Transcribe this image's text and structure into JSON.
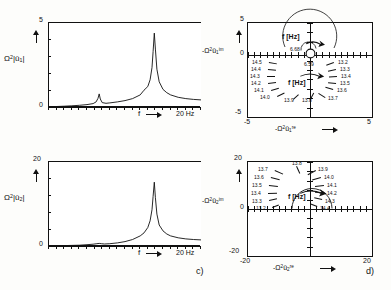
{
  "figure": {
    "captions": [
      {
        "id": "c",
        "text": "c)"
      },
      {
        "id": "d",
        "text": "d)"
      }
    ]
  },
  "panels": {
    "top_left": {
      "ylabel_base": "Ω",
      "ylabel_exp": "2",
      "ylabel_arg": "|û",
      "ylabel_sub": "1",
      "ylabel_tail": "|",
      "ytick_top": "5",
      "ytick_bottom": "0",
      "xlabel": "f",
      "xend": "20 Hz"
    },
    "bottom_left": {
      "ylabel_base": "Ω",
      "ylabel_exp": "2",
      "ylabel_arg": "|û",
      "ylabel_sub": "2",
      "ylabel_tail": "|",
      "ytick_top": "20",
      "ytick_bottom": "0",
      "xlabel": "f",
      "xend": "20 Hz"
    },
    "top_right": {
      "ylabel_pre": "-Ω",
      "ylabel_exp": "2",
      "ylabel_arg": "û",
      "ylabel_sub": "1",
      "ylabel_sup": "im",
      "xlabel_pre": "-Ω",
      "xlabel_exp": "2",
      "xlabel_arg": "û",
      "xlabel_sub": "1",
      "xlabel_sup": "re",
      "ytick_top": "5",
      "ytick_zero": "0",
      "ytick_bottom": "-5",
      "xtick_left": "-5",
      "xtick_right": "5",
      "annotation_upper": "f [Hz]",
      "annotation_lower": "f [Hz]",
      "small_loop_labels": [
        "6.68",
        "6.59"
      ],
      "freq_labels_left": [
        "14.5",
        "14.4",
        "14.3",
        "14.2",
        "14.1",
        "14.0"
      ],
      "freq_labels_bottom": [
        "13.9",
        "13.8"
      ],
      "freq_labels_right": [
        "13.2",
        "13.3",
        "13.4",
        "13.5",
        "13.6",
        "13.7"
      ]
    },
    "bottom_right": {
      "ylabel_pre": "-Ω",
      "ylabel_exp": "2",
      "ylabel_arg": "û",
      "ylabel_sub": "2",
      "ylabel_sup": "im",
      "xlabel_pre": "-Ω",
      "xlabel_exp": "2",
      "xlabel_arg": "û",
      "xlabel_sub": "2",
      "xlabel_sup": "re",
      "ytick_top": "20",
      "ytick_zero": "0",
      "ytick_bottom": "-20",
      "xtick_left": "-20",
      "xtick_right": "20",
      "annotation": "f [Hz]",
      "freq_labels_left": [
        "13.7",
        "13.6",
        "13.5",
        "13.4",
        "13.3",
        "13.2"
      ],
      "freq_labels_top": [
        "13.8"
      ],
      "freq_labels_right": [
        "13.9",
        "14.0",
        "14.1",
        "14.2",
        "14.3",
        "14.4"
      ]
    }
  },
  "chart_data": [
    {
      "type": "line",
      "panel": "top_left",
      "title": "",
      "xlabel": "f",
      "ylabel": "Ω²|û₁|",
      "xlim": [
        0,
        20
      ],
      "ylim": [
        0,
        5
      ],
      "xunit": "Hz",
      "grid": false,
      "xticks": [
        0,
        1,
        2,
        3,
        4,
        5,
        6,
        7,
        8,
        9,
        10,
        11,
        12,
        13,
        14,
        15,
        16,
        17,
        18,
        19,
        20
      ],
      "yticks": [
        0,
        1,
        2,
        3,
        4,
        5
      ],
      "resonances": [
        {
          "frequency": 6.6,
          "amplitude": 0.75
        },
        {
          "frequency": 13.85,
          "amplitude": 4.4
        }
      ],
      "x": [
        0,
        1,
        2,
        3,
        4,
        5,
        5.8,
        6.2,
        6.45,
        6.6,
        6.75,
        7.0,
        7.5,
        8,
        9,
        10,
        11,
        12,
        12.5,
        13,
        13.3,
        13.55,
        13.7,
        13.85,
        14.0,
        14.2,
        14.5,
        15,
        15.5,
        16,
        17,
        18,
        19,
        20
      ],
      "y": [
        0.02,
        0.03,
        0.05,
        0.07,
        0.1,
        0.14,
        0.2,
        0.3,
        0.52,
        0.78,
        0.48,
        0.26,
        0.22,
        0.24,
        0.3,
        0.38,
        0.5,
        0.72,
        0.88,
        1.22,
        1.62,
        2.35,
        3.3,
        4.4,
        3.45,
        2.25,
        1.5,
        1.05,
        0.85,
        0.72,
        0.58,
        0.5,
        0.45,
        0.42
      ]
    },
    {
      "type": "line",
      "panel": "bottom_left",
      "title": "",
      "xlabel": "f",
      "ylabel": "Ω²|û₂|",
      "xlim": [
        0,
        20
      ],
      "ylim": [
        0,
        20
      ],
      "xunit": "Hz",
      "grid": false,
      "xticks": [
        0,
        1,
        2,
        3,
        4,
        5,
        6,
        7,
        8,
        9,
        10,
        11,
        12,
        13,
        14,
        15,
        16,
        17,
        18,
        19,
        20
      ],
      "yticks": [
        0,
        4,
        8,
        12,
        16,
        20
      ],
      "resonances": [
        {
          "frequency": 6.6,
          "amplitude": 0.6
        },
        {
          "frequency": 13.85,
          "amplitude": 15.2
        }
      ],
      "x": [
        0,
        1,
        2,
        3,
        4,
        5,
        5.8,
        6.3,
        6.6,
        6.9,
        7.3,
        8,
        9,
        10,
        11,
        12,
        12.5,
        13,
        13.3,
        13.55,
        13.7,
        13.85,
        14.0,
        14.2,
        14.5,
        15,
        15.5,
        16,
        17,
        18,
        19,
        20
      ],
      "y": [
        0.05,
        0.07,
        0.1,
        0.14,
        0.2,
        0.3,
        0.42,
        0.55,
        0.62,
        0.55,
        0.48,
        0.55,
        0.75,
        1.05,
        1.55,
        2.4,
        3.1,
        4.4,
        6.0,
        8.6,
        11.8,
        15.2,
        11.5,
        7.6,
        5.0,
        3.55,
        2.85,
        2.4,
        1.95,
        1.7,
        1.55,
        1.45
      ]
    },
    {
      "type": "scatter",
      "subtype": "nyquist",
      "panel": "top_right",
      "title": "",
      "xlabel": "-Ω²û₁ʳᵉ",
      "ylabel": "-Ω²û₁ⁱᵐ",
      "xlim": [
        -5,
        5
      ],
      "ylim": [
        -5,
        5
      ],
      "grid": false,
      "annotations": [
        "f [Hz]",
        "f [Hz]"
      ],
      "main_loop": {
        "description": "large resonance circle in lower half-plane centred near origin",
        "center": [
          0.0,
          -2.1
        ],
        "radius": 2.2,
        "labeled_points": [
          {
            "f": 14.5,
            "x": -2.05,
            "y": -1.15
          },
          {
            "f": 14.4,
            "x": -2.2,
            "y": -1.6
          },
          {
            "f": 14.3,
            "x": -2.2,
            "y": -2.1
          },
          {
            "f": 14.2,
            "x": -2.05,
            "y": -2.6
          },
          {
            "f": 14.1,
            "x": -1.7,
            "y": -3.15
          },
          {
            "f": 14.0,
            "x": -1.15,
            "y": -3.6
          },
          {
            "f": 13.9,
            "x": -0.35,
            "y": -3.85
          },
          {
            "f": 13.8,
            "x": 0.55,
            "y": -3.8
          },
          {
            "f": 13.7,
            "x": 1.35,
            "y": -3.45
          },
          {
            "f": 13.6,
            "x": 1.95,
            "y": -2.9
          },
          {
            "f": 13.5,
            "x": 2.25,
            "y": -2.35
          },
          {
            "f": 13.4,
            "x": 2.35,
            "y": -1.85
          },
          {
            "f": 13.3,
            "x": 2.25,
            "y": -1.35
          },
          {
            "f": 13.2,
            "x": 2.0,
            "y": -0.9
          }
        ]
      },
      "small_loop": {
        "description": "small resonance loop near origin",
        "center": [
          0.1,
          0.25
        ],
        "radius": 0.45,
        "labeled_points": [
          {
            "f": 6.68,
            "x": -0.55,
            "y": 0.3
          },
          {
            "f": 6.59,
            "x": 0.05,
            "y": -0.45
          }
        ]
      }
    },
    {
      "type": "scatter",
      "subtype": "nyquist",
      "panel": "bottom_right",
      "title": "",
      "xlabel": "-Ω²û₂ʳᵉ",
      "ylabel": "-Ω²û₂ⁱᵐ",
      "xlim": [
        -20,
        20
      ],
      "ylim": [
        -20,
        20
      ],
      "grid": false,
      "annotations": [
        "f [Hz]"
      ],
      "main_loop": {
        "description": "resonance circle in upper half-plane just above real axis",
        "center": [
          0.5,
          7.5
        ],
        "radius": 7.0,
        "labeled_points": [
          {
            "f": 13.2,
            "x": -5.2,
            "y": 1.3
          },
          {
            "f": 13.3,
            "x": -6.1,
            "y": 2.6
          },
          {
            "f": 13.4,
            "x": -6.6,
            "y": 4.1
          },
          {
            "f": 13.5,
            "x": -6.7,
            "y": 5.8
          },
          {
            "f": 13.6,
            "x": -6.2,
            "y": 8.3
          },
          {
            "f": 13.7,
            "x": -4.8,
            "y": 11.2
          },
          {
            "f": 13.8,
            "x": -0.6,
            "y": 13.6
          },
          {
            "f": 13.9,
            "x": 4.2,
            "y": 12.6
          },
          {
            "f": 14.0,
            "x": 6.3,
            "y": 10.4
          },
          {
            "f": 14.1,
            "x": 7.2,
            "y": 8.1
          },
          {
            "f": 14.2,
            "x": 7.3,
            "y": 6.0
          },
          {
            "f": 14.3,
            "x": 6.9,
            "y": 4.1
          },
          {
            "f": 14.4,
            "x": 6.2,
            "y": 2.4
          }
        ]
      }
    }
  ]
}
